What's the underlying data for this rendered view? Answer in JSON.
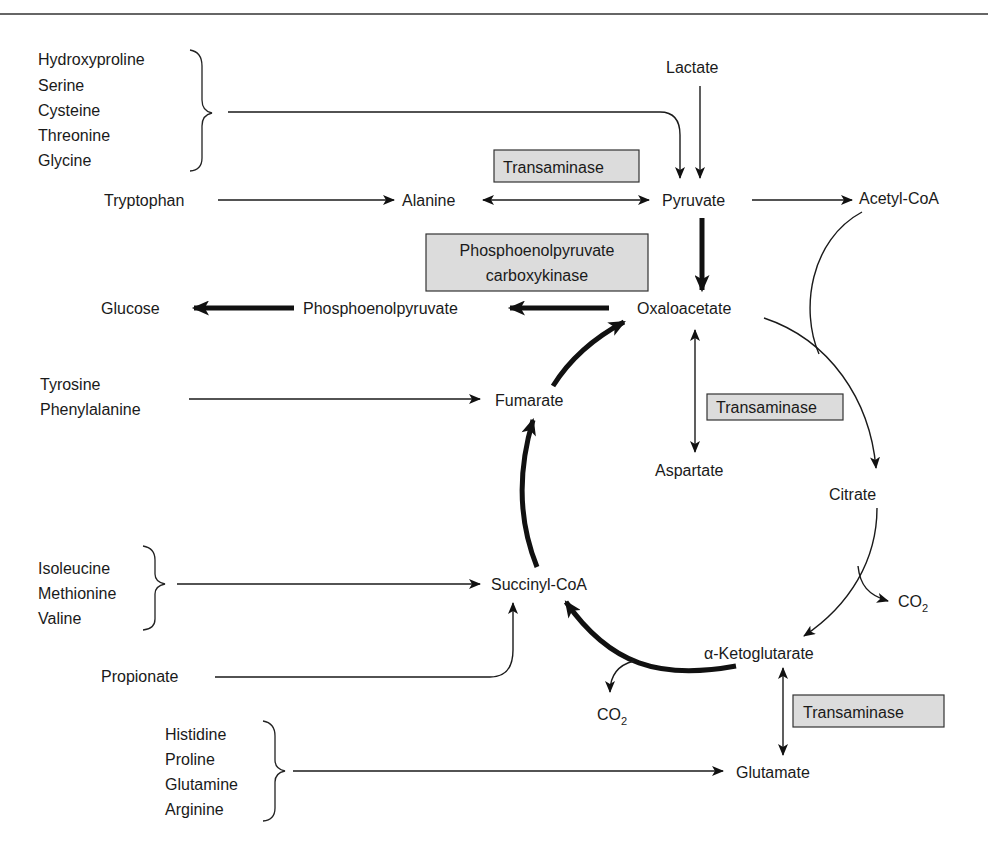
{
  "diagram": {
    "type": "metabolic-pathway"
  },
  "metabolites": {
    "lactate": "Lactate",
    "pyruvate": "Pyruvate",
    "acetyl_coa": "Acetyl-CoA",
    "alanine": "Alanine",
    "oxaloacetate": "Oxaloacetate",
    "phosphoenolpyruvate": "Phosphoenolpyruvate",
    "glucose": "Glucose",
    "fumarate": "Fumarate",
    "aspartate": "Aspartate",
    "citrate": "Citrate",
    "succinyl_coa": "Succinyl-CoA",
    "alpha_ketoglutarate": "α-Ketoglutarate",
    "glutamate": "Glutamate",
    "propionate": "Propionate",
    "co2_main": "CO",
    "co2_sub": "2"
  },
  "amino_acid_groups": {
    "to_pyruvate": [
      "Hydroxyproline",
      "Serine",
      "Cysteine",
      "Threonine",
      "Glycine"
    ],
    "to_alanine": [
      "Tryptophan"
    ],
    "to_fumarate": [
      "Tyrosine",
      "Phenylalanine"
    ],
    "to_succinyl_coa": [
      "Isoleucine",
      "Methionine",
      "Valine"
    ],
    "to_glutamate": [
      "Histidine",
      "Proline",
      "Glutamine",
      "Arginine"
    ]
  },
  "enzymes": {
    "transaminase_alanine": "Transaminase",
    "pepck_line1": "Phosphoenolpyruvate",
    "pepck_line2": "carboxykinase",
    "transaminase_aspartate": "Transaminase",
    "transaminase_glutamate": "Transaminase"
  },
  "colors": {
    "enzyme_box_fill": "#dcdcdc",
    "line": "#1a1a1a",
    "background": "#ffffff"
  }
}
